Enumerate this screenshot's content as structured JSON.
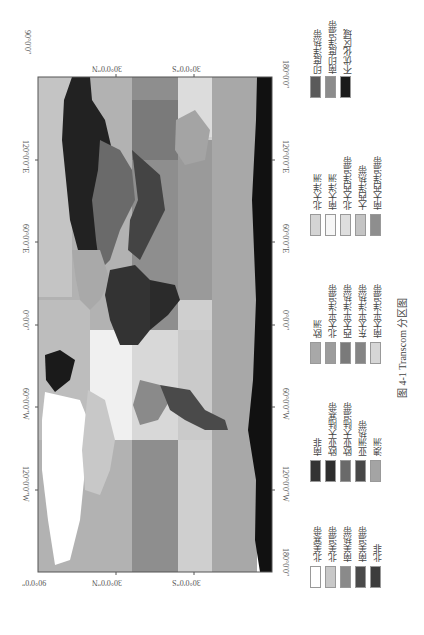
{
  "figure": {
    "caption": "图 4-1   Transcom 分区图",
    "caption_number": "图 4-1",
    "caption_title": "Transcom 分区图",
    "orientation": "rotated 90° counter-clockwise (latitude horizontal, longitude vertical)"
  },
  "map": {
    "latitude_ticks_top": [
      "90°0′0″",
      "30°0′0″N",
      "30°0′0″S",
      "90°0′0″"
    ],
    "latitude_ticks_bottom": [
      "90°0′0″",
      "30°0′0″N",
      "30°0′0″S"
    ],
    "longitude_ticks_left": [
      "180°0′0″",
      "120°0′0″E",
      "60°0′0″E",
      "0°0′0″",
      "60°0′0″W",
      "120°0′0″W"
    ],
    "longitude_ticks_right": [
      "180°0′0″",
      "120°0′0″E",
      "60°0′0″E",
      "0°0′0″",
      "60°0′0″W",
      "120°0′0″W",
      "180°0′0″"
    ],
    "corner_labels": {
      "top_left": "90°0′0″",
      "top_right": "180°0′0″",
      "bottom_left": "90°0′0″",
      "bottom_right": "180°0′0″"
    }
  },
  "legend": {
    "columns": [
      {
        "items": [
          {
            "label": "北美寒带",
            "color": "#ffffff"
          },
          {
            "label": "北美温带",
            "color": "#c8c8c8"
          },
          {
            "label": "南美热带",
            "color": "#8a8a8a"
          },
          {
            "label": "南美温带",
            "color": "#4a4a4a"
          },
          {
            "label": "北非",
            "color": "#3c3c3c"
          }
        ]
      },
      {
        "items": [
          {
            "label": "南非",
            "color": "#333333"
          },
          {
            "label": "欧亚大陆寒带",
            "color": "#2e2e2e"
          },
          {
            "label": "欧亚大陆温带",
            "color": "#6a6a6a"
          },
          {
            "label": "亚洲热带",
            "color": "#484848"
          },
          {
            "label": "澳洲",
            "color": "#a4a4a4"
          }
        ]
      },
      {
        "items": [
          {
            "label": "欧洲",
            "color": "#a8a8a8"
          },
          {
            "label": "北太平洋温带",
            "color": "#9c9c9c"
          },
          {
            "label": "西太平洋热带",
            "color": "#7a7a7a"
          },
          {
            "label": "东太平洋热带",
            "color": "#858585"
          },
          {
            "label": "南太平洋温带",
            "color": "#d6d6d6"
          }
        ]
      },
      {
        "items": [
          {
            "label": "北大洋洲",
            "color": "#d4d4d4"
          },
          {
            "label": "南大洋洲",
            "color": "#f6f6f6"
          },
          {
            "label": "北大西洋温带",
            "color": "#dedede"
          },
          {
            "label": "大西洋热带",
            "color": "#c4c4c4"
          },
          {
            "label": "南大西洋温带",
            "color": "#8e8e8e"
          }
        ]
      },
      {
        "items": [
          {
            "label": "印度洋热带",
            "color": "#5a5a5a"
          },
          {
            "label": "南印度洋温带",
            "color": "#8c8c8c"
          },
          {
            "label": "不优化区域",
            "color": "#1a1a1a"
          }
        ]
      }
    ]
  },
  "colors": {
    "frame": "#555555",
    "ocean_north": "#b4b4b4",
    "ocean_band_1": "#9a9a9a",
    "ocean_band_2": "#cfcfcf",
    "ocean_band_3": "#a9a9a9",
    "antarctica": "#111111"
  }
}
